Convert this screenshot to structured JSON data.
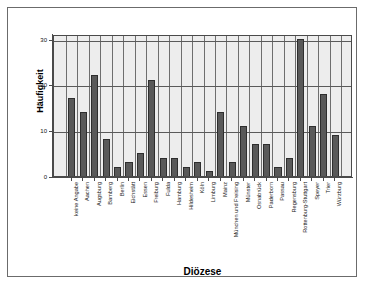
{
  "chart_data": {
    "type": "bar",
    "title": "",
    "xlabel": "Diözese",
    "ylabel": "Häufigkeit",
    "ylim": [
      0,
      31
    ],
    "yticks": [
      0,
      10,
      20,
      30
    ],
    "ytick_labels": [
      "0",
      "10",
      "20",
      "30"
    ],
    "grid": true,
    "legend": null,
    "bar_color": "#595959",
    "plot_background": "#ededed",
    "categories": [
      "keine Angabe",
      "Aachen",
      "Augsburg",
      "Bamberg",
      "Berlin",
      "Eichstätt",
      "Essen",
      "Freiburg",
      "Fulda",
      "Hamburg",
      "Hildesheim",
      "Köln",
      "Limburg",
      "Mainz",
      "München und Freising",
      "Münster",
      "Osnabrück",
      "Paderborn",
      "Passau",
      "Regensburg",
      "Rottenburg-Stuttgart",
      "Speyer",
      "Trier",
      "Würzburg"
    ],
    "values": [
      17,
      14,
      22,
      8,
      2,
      3,
      5,
      21,
      4,
      4,
      2,
      3,
      1,
      14,
      3,
      11,
      7,
      7,
      2,
      4,
      30,
      11,
      18,
      9
    ]
  }
}
